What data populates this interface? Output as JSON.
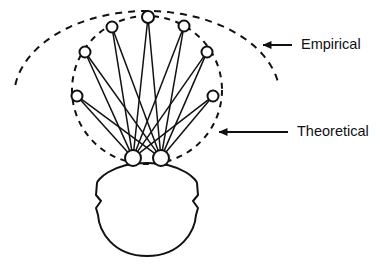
{
  "figure": {
    "background_color": "#ffffff",
    "stroke_color": "#111111",
    "node_fill_color": "#ffffff"
  },
  "labels": {
    "empirical": "Empirical",
    "theoretical": "Theoretical"
  },
  "annotations": [
    {
      "name": "empirical-annotation",
      "text": "Empirical",
      "text_x": 293,
      "text_y": 45,
      "arrow_tail_x": 292,
      "arrow_tail_y": 45,
      "arrow_head_x": 263,
      "arrow_head_y": 45
    },
    {
      "name": "theoretical-annotation",
      "text": "Theoretical",
      "text_x": 289,
      "text_y": 132,
      "arrow_tail_x": 288,
      "arrow_tail_y": 132,
      "arrow_head_x": 219,
      "arrow_head_y": 132
    }
  ],
  "chart_data": {
    "type": "diagram",
    "empirical_curve": {
      "label": "Empirical",
      "style": "dashed",
      "shape": "ellipse-arc",
      "center_x": 147,
      "center_y": 97,
      "radius_x": 133,
      "radius_y": 86,
      "arc_start_deg": 188,
      "arc_end_deg": 352
    },
    "theoretical_curve": {
      "label": "Theoretical",
      "style": "dashed",
      "shape": "ellipse",
      "center_x": 147,
      "center_y": 90,
      "radius_x": 75,
      "radius_y": 74
    },
    "sensor_nodes": [
      {
        "id": "n1",
        "x": 85,
        "y": 52,
        "r": 5.5
      },
      {
        "id": "n2",
        "x": 112,
        "y": 27,
        "r": 5.5
      },
      {
        "id": "n3",
        "x": 148,
        "y": 17,
        "r": 6.0
      },
      {
        "id": "n4",
        "x": 184,
        "y": 26,
        "r": 5.5
      },
      {
        "id": "n5",
        "x": 207,
        "y": 52,
        "r": 5.5
      },
      {
        "id": "n6",
        "x": 77,
        "y": 96,
        "r": 5.5
      },
      {
        "id": "n7",
        "x": 213,
        "y": 96,
        "r": 5.5
      }
    ],
    "base_nodes": [
      {
        "id": "b1",
        "x": 133,
        "y": 158,
        "r": 8.0
      },
      {
        "id": "b2",
        "x": 161,
        "y": 158,
        "r": 8.0
      }
    ],
    "edges": [
      {
        "from": "b1",
        "to": "n1"
      },
      {
        "from": "b1",
        "to": "n2"
      },
      {
        "from": "b1",
        "to": "n3"
      },
      {
        "from": "b1",
        "to": "n4"
      },
      {
        "from": "b1",
        "to": "n5"
      },
      {
        "from": "b1",
        "to": "n6"
      },
      {
        "from": "b1",
        "to": "n7"
      },
      {
        "from": "b2",
        "to": "n1"
      },
      {
        "from": "b2",
        "to": "n2"
      },
      {
        "from": "b2",
        "to": "n3"
      },
      {
        "from": "b2",
        "to": "n4"
      },
      {
        "from": "b2",
        "to": "n5"
      },
      {
        "from": "b2",
        "to": "n6"
      },
      {
        "from": "b2",
        "to": "n7"
      }
    ],
    "head_outline": {
      "label": "head",
      "style": "solid",
      "center_x": 147,
      "top_y": 163,
      "bottom_y": 256,
      "half_width": 50,
      "ear_left_x": 98,
      "ear_right_x": 196,
      "ear_y": 205
    }
  }
}
